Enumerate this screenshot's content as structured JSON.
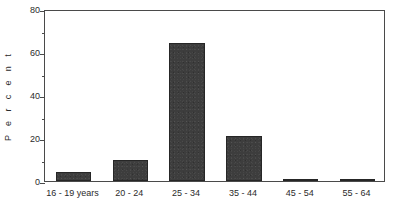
{
  "chart_data": {
    "type": "bar",
    "title": "",
    "subtitle": "",
    "xlabel": "",
    "ylabel": "Percent",
    "ylabel_spaced": "P e r c e n t",
    "categories": [
      "16 - 19 years",
      "20 - 24",
      "25 - 34",
      "35 - 44",
      "45 - 54",
      "55 - 64"
    ],
    "values": [
      4,
      10,
      64,
      21,
      1,
      0.5
    ],
    "ylim": [
      0,
      80
    ],
    "xlim": [
      0,
      6
    ],
    "y_major_ticks": [
      0,
      20,
      40,
      60,
      80
    ],
    "y_minor_ticks": [
      10,
      30,
      50,
      70
    ],
    "y_tick_labels": [
      "0",
      "20",
      "40",
      "60",
      "80"
    ],
    "grid": false,
    "legend": false,
    "legend_position": "none",
    "bar_color": "#3d3d3d",
    "bar_edge_color": "#262626",
    "axis_color": "#4a4a4a",
    "background_color": "#ffffff",
    "bar_width_fraction": 0.62
  },
  "figure": {
    "name": "percent-by-age-group-bar-chart"
  }
}
